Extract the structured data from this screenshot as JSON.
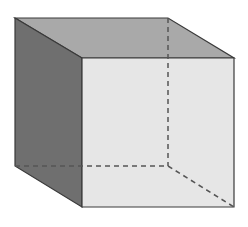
{
  "diagram": {
    "type": "cube-wireframe-shaded",
    "vertices": {
      "back_top_left": [
        15,
        18
      ],
      "back_top_right": [
        168,
        18
      ],
      "back_bottom_left": [
        15,
        166
      ],
      "back_bottom_right": [
        168,
        166
      ],
      "front_top_left": [
        82,
        58
      ],
      "front_top_right": [
        234,
        58
      ],
      "front_bottom_left": [
        82,
        207
      ],
      "front_bottom_right": [
        234,
        207
      ]
    },
    "faces": {
      "top": "#a9a9a9",
      "left": "#6f6f6f",
      "front": "#e6e6e6"
    },
    "edge_color": "#3a3a3a",
    "hidden_edge_color": "#555555"
  }
}
